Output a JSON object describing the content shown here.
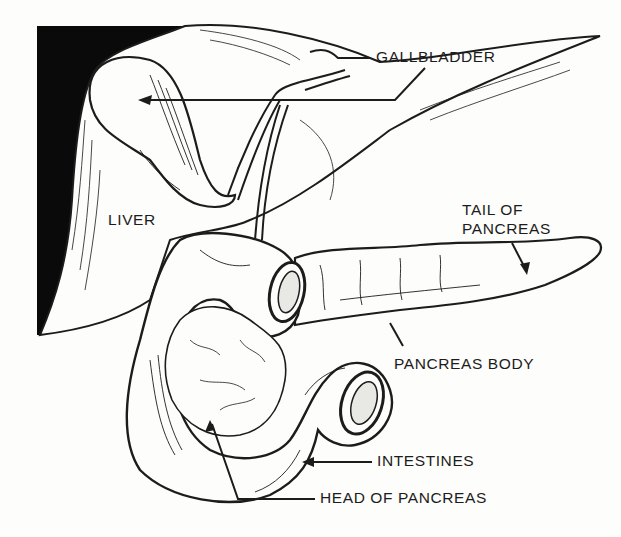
{
  "diagram": {
    "style": "black-and-white line engraving",
    "colors": {
      "ink": "#1c1c1c",
      "paper": "#fdfdfb",
      "shadow": "#0a0a0a"
    },
    "labels": {
      "gallbladder": "GALLBLADDER",
      "liver": "LIVER",
      "tail_of_pancreas_line1": "TAIL OF",
      "tail_of_pancreas_line2": "PANCREAS",
      "pancreas_body": "PANCREAS BODY",
      "intestines": "INTESTINES",
      "head_of_pancreas": "HEAD OF PANCREAS"
    }
  }
}
